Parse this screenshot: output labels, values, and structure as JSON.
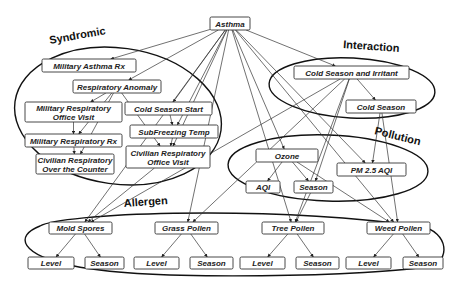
{
  "diagram": {
    "root": {
      "id": "asthma",
      "label": "Asthma"
    },
    "groups": [
      {
        "id": "syndromic",
        "label": "Syndromic"
      },
      {
        "id": "interaction",
        "label": "Interaction"
      },
      {
        "id": "pollution",
        "label": "Pollution"
      },
      {
        "id": "allergen",
        "label": "Allergen"
      }
    ],
    "nodes": {
      "asthma": {
        "lines": [
          "Asthma"
        ],
        "x": 210,
        "y": 17,
        "w": 40,
        "h": 13
      },
      "military_asthma_rx": {
        "lines": [
          "Military Asthma Rx"
        ],
        "x": 42,
        "y": 59,
        "w": 94,
        "h": 13
      },
      "respiratory_anomaly": {
        "lines": [
          "Respiratory Anomaly"
        ],
        "x": 73,
        "y": 80,
        "w": 88,
        "h": 13
      },
      "military_resp_office_visit": {
        "lines": [
          "Military Respiratory",
          "Office Visit"
        ],
        "x": 25,
        "y": 102,
        "w": 97,
        "h": 20
      },
      "cold_season_start": {
        "lines": [
          "Cold Season Start"
        ],
        "x": 125,
        "y": 102,
        "w": 87,
        "h": 13
      },
      "subfreezing_temp": {
        "lines": [
          "SubFreezing Temp"
        ],
        "x": 130,
        "y": 125,
        "w": 88,
        "h": 13
      },
      "military_resp_rx": {
        "lines": [
          "Military Respiratory Rx"
        ],
        "x": 25,
        "y": 134,
        "w": 97,
        "h": 13
      },
      "civilian_resp_otc": {
        "lines": [
          "Civilian Respiratory",
          "Over the Counter"
        ],
        "x": 36,
        "y": 154,
        "w": 78,
        "h": 20
      },
      "civilian_resp_office_visit": {
        "lines": [
          "Civilian Respiratory",
          "Office Visit"
        ],
        "x": 126,
        "y": 146,
        "w": 84,
        "h": 22
      },
      "cold_season_irritant": {
        "lines": [
          "Cold Season and Irritant"
        ],
        "x": 294,
        "y": 66,
        "w": 115,
        "h": 13
      },
      "cold_season": {
        "lines": [
          "Cold Season"
        ],
        "x": 346,
        "y": 100,
        "w": 70,
        "h": 13
      },
      "ozone": {
        "lines": [
          "Ozone"
        ],
        "x": 256,
        "y": 149,
        "w": 62,
        "h": 13
      },
      "pm25_aqi": {
        "lines": [
          "PM 2.5 AQI"
        ],
        "x": 337,
        "y": 163,
        "w": 69,
        "h": 13
      },
      "ozone_aqi": {
        "lines": [
          "AQI"
        ],
        "x": 246,
        "y": 181,
        "w": 34,
        "h": 12
      },
      "ozone_season": {
        "lines": [
          "Season"
        ],
        "x": 294,
        "y": 181,
        "w": 39,
        "h": 12
      },
      "mold_spores": {
        "lines": [
          "Mold Spores"
        ],
        "x": 49,
        "y": 222,
        "w": 63,
        "h": 12
      },
      "grass_pollen": {
        "lines": [
          "Grass Pollen"
        ],
        "x": 155,
        "y": 222,
        "w": 63,
        "h": 12
      },
      "tree_pollen": {
        "lines": [
          "Tree Pollen"
        ],
        "x": 262,
        "y": 222,
        "w": 62,
        "h": 12
      },
      "weed_pollen": {
        "lines": [
          "Weed Pollen"
        ],
        "x": 367,
        "y": 222,
        "w": 63,
        "h": 12
      },
      "mold_level": {
        "lines": [
          "Level"
        ],
        "x": 28,
        "y": 257,
        "w": 46,
        "h": 12
      },
      "mold_season": {
        "lines": [
          "Season"
        ],
        "x": 85,
        "y": 257,
        "w": 39,
        "h": 12
      },
      "grass_level": {
        "lines": [
          "Level"
        ],
        "x": 134,
        "y": 257,
        "w": 45,
        "h": 12
      },
      "grass_season": {
        "lines": [
          "Season"
        ],
        "x": 190,
        "y": 257,
        "w": 43,
        "h": 12
      },
      "tree_level": {
        "lines": [
          "Level"
        ],
        "x": 240,
        "y": 257,
        "w": 45,
        "h": 12
      },
      "tree_season": {
        "lines": [
          "Season"
        ],
        "x": 296,
        "y": 257,
        "w": 43,
        "h": 12
      },
      "weed_level": {
        "lines": [
          "Level"
        ],
        "x": 346,
        "y": 257,
        "w": 45,
        "h": 12
      },
      "weed_season": {
        "lines": [
          "Season"
        ],
        "x": 403,
        "y": 257,
        "w": 40,
        "h": 12
      }
    },
    "edges": [
      [
        "asthma",
        "military_asthma_rx"
      ],
      [
        "asthma",
        "respiratory_anomaly"
      ],
      [
        "asthma",
        "cold_season_start"
      ],
      [
        "asthma",
        "subfreezing_temp"
      ],
      [
        "asthma",
        "civilian_resp_office_visit"
      ],
      [
        "asthma",
        "cold_season_irritant"
      ],
      [
        "asthma",
        "ozone"
      ],
      [
        "asthma",
        "pm25_aqi"
      ],
      [
        "asthma",
        "mold_spores"
      ],
      [
        "asthma",
        "grass_pollen"
      ],
      [
        "asthma",
        "tree_pollen"
      ],
      [
        "asthma",
        "weed_pollen"
      ],
      [
        "respiratory_anomaly",
        "military_resp_office_visit"
      ],
      [
        "respiratory_anomaly",
        "military_resp_rx"
      ],
      [
        "respiratory_anomaly",
        "civilian_resp_otc"
      ],
      [
        "respiratory_anomaly",
        "civilian_resp_office_visit"
      ],
      [
        "military_resp_office_visit",
        "military_resp_rx"
      ],
      [
        "military_resp_rx",
        "civilian_resp_otc"
      ],
      [
        "cold_season_start",
        "subfreezing_temp"
      ],
      [
        "subfreezing_temp",
        "civilian_resp_office_visit"
      ],
      [
        "cold_season_irritant",
        "cold_season"
      ],
      [
        "cold_season_irritant",
        "mold_spores"
      ],
      [
        "cold_season_irritant",
        "grass_pollen"
      ],
      [
        "cold_season_irritant",
        "tree_pollen"
      ],
      [
        "cold_season_irritant",
        "ozone_season"
      ],
      [
        "cold_season",
        "pm25_aqi"
      ],
      [
        "cold_season",
        "weed_pollen"
      ],
      [
        "ozone",
        "ozone_aqi"
      ],
      [
        "ozone",
        "ozone_season"
      ],
      [
        "ozone",
        "weed_pollen"
      ],
      [
        "ozone_season",
        "tree_pollen"
      ],
      [
        "civilian_resp_office_visit",
        "mold_spores"
      ],
      [
        "mold_spores",
        "mold_level"
      ],
      [
        "mold_spores",
        "mold_season"
      ],
      [
        "grass_pollen",
        "grass_level"
      ],
      [
        "grass_pollen",
        "grass_season"
      ],
      [
        "tree_pollen",
        "tree_level"
      ],
      [
        "tree_pollen",
        "tree_season"
      ],
      [
        "weed_pollen",
        "weed_level"
      ],
      [
        "weed_pollen",
        "weed_season"
      ]
    ]
  }
}
